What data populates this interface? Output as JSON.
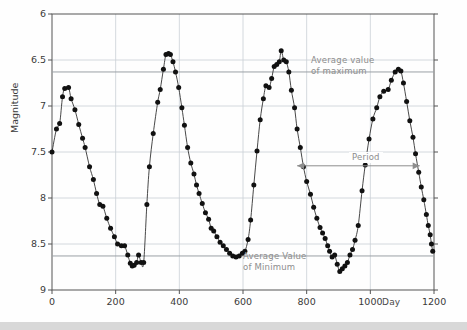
{
  "chart_data": {
    "type": "scatter",
    "title": "",
    "xlabel": "Day",
    "ylabel": "Magnitude",
    "xlim": [
      0,
      1200
    ],
    "ylim": [
      9,
      6
    ],
    "y_inverted": true,
    "grid": true,
    "xticks": [
      0,
      200,
      400,
      600,
      800,
      1000,
      1200
    ],
    "xtick_labels": [
      "0",
      "200",
      "400",
      "600",
      "800",
      "1000",
      "1200"
    ],
    "yticks": [
      6,
      6.5,
      7,
      7.5,
      8,
      8.5,
      9
    ],
    "ytick_labels": [
      "6",
      "6.5",
      "7",
      "7.5",
      "8",
      "8.5",
      "9"
    ],
    "reference_lines": [
      {
        "name": "average-value-of-maximum",
        "y": 6.63,
        "label": "Average value\nof maximum"
      },
      {
        "name": "average-value-of-minimum",
        "y": 8.63,
        "label": "Average Value\nof Minimum"
      }
    ],
    "annotations": [
      {
        "name": "period-span",
        "label": "Period",
        "x_start": 770,
        "x_end": 1155,
        "y": 7.65
      }
    ],
    "series": [
      {
        "name": "variable-star-light-curve",
        "marker": "filled-circle",
        "line": "smooth",
        "points": [
          [
            0,
            7.5
          ],
          [
            14,
            7.25
          ],
          [
            24,
            7.19
          ],
          [
            33,
            6.9
          ],
          [
            40,
            6.81
          ],
          [
            52,
            6.8
          ],
          [
            60,
            6.92
          ],
          [
            72,
            7.04
          ],
          [
            84,
            7.2
          ],
          [
            96,
            7.35
          ],
          [
            104,
            7.45
          ],
          [
            118,
            7.66
          ],
          [
            130,
            7.8
          ],
          [
            140,
            7.95
          ],
          [
            150,
            8.07
          ],
          [
            160,
            8.09
          ],
          [
            172,
            8.22
          ],
          [
            184,
            8.33
          ],
          [
            196,
            8.42
          ],
          [
            206,
            8.5
          ],
          [
            218,
            8.52
          ],
          [
            228,
            8.52
          ],
          [
            238,
            8.62
          ],
          [
            246,
            8.71
          ],
          [
            252,
            8.74
          ],
          [
            258,
            8.73
          ],
          [
            266,
            8.7
          ],
          [
            272,
            8.62
          ],
          [
            280,
            8.7
          ],
          [
            288,
            8.7
          ],
          [
            298,
            8.07
          ],
          [
            306,
            7.66
          ],
          [
            318,
            7.3
          ],
          [
            332,
            6.96
          ],
          [
            340,
            6.82
          ],
          [
            350,
            6.6
          ],
          [
            358,
            6.44
          ],
          [
            366,
            6.43
          ],
          [
            372,
            6.44
          ],
          [
            380,
            6.52
          ],
          [
            388,
            6.63
          ],
          [
            398,
            6.8
          ],
          [
            408,
            7.02
          ],
          [
            416,
            7.21
          ],
          [
            426,
            7.45
          ],
          [
            436,
            7.62
          ],
          [
            446,
            7.74
          ],
          [
            454,
            7.86
          ],
          [
            462,
            7.95
          ],
          [
            472,
            8.06
          ],
          [
            482,
            8.16
          ],
          [
            492,
            8.23
          ],
          [
            500,
            8.33
          ],
          [
            508,
            8.36
          ],
          [
            518,
            8.42
          ],
          [
            528,
            8.48
          ],
          [
            538,
            8.52
          ],
          [
            548,
            8.56
          ],
          [
            558,
            8.6
          ],
          [
            568,
            8.63
          ],
          [
            578,
            8.64
          ],
          [
            588,
            8.63
          ],
          [
            598,
            8.6
          ],
          [
            606,
            8.58
          ],
          [
            616,
            8.45
          ],
          [
            624,
            8.24
          ],
          [
            634,
            7.86
          ],
          [
            644,
            7.49
          ],
          [
            654,
            7.15
          ],
          [
            664,
            6.92
          ],
          [
            672,
            6.78
          ],
          [
            682,
            6.8
          ],
          [
            690,
            6.7
          ],
          [
            698,
            6.57
          ],
          [
            706,
            6.55
          ],
          [
            714,
            6.52
          ],
          [
            720,
            6.4
          ],
          [
            728,
            6.5
          ],
          [
            736,
            6.52
          ],
          [
            744,
            6.63
          ],
          [
            752,
            6.83
          ],
          [
            762,
            7.02
          ],
          [
            770,
            7.25
          ],
          [
            780,
            7.45
          ],
          [
            790,
            7.66
          ],
          [
            800,
            7.82
          ],
          [
            812,
            7.96
          ],
          [
            822,
            8.1
          ],
          [
            832,
            8.22
          ],
          [
            842,
            8.32
          ],
          [
            850,
            8.38
          ],
          [
            858,
            8.44
          ],
          [
            866,
            8.52
          ],
          [
            872,
            8.58
          ],
          [
            880,
            8.64
          ],
          [
            888,
            8.62
          ],
          [
            896,
            8.72
          ],
          [
            904,
            8.8
          ],
          [
            912,
            8.77
          ],
          [
            920,
            8.74
          ],
          [
            928,
            8.7
          ],
          [
            936,
            8.62
          ],
          [
            944,
            8.56
          ],
          [
            952,
            8.46
          ],
          [
            962,
            8.3
          ],
          [
            974,
            7.92
          ],
          [
            984,
            7.64
          ],
          [
            996,
            7.36
          ],
          [
            1008,
            7.14
          ],
          [
            1020,
            7.02
          ],
          [
            1030,
            6.9
          ],
          [
            1042,
            6.84
          ],
          [
            1056,
            6.82
          ],
          [
            1066,
            6.72
          ],
          [
            1078,
            6.63
          ],
          [
            1088,
            6.6
          ],
          [
            1096,
            6.62
          ],
          [
            1104,
            6.75
          ],
          [
            1114,
            6.95
          ],
          [
            1124,
            7.16
          ],
          [
            1134,
            7.34
          ],
          [
            1142,
            7.52
          ],
          [
            1152,
            7.72
          ],
          [
            1160,
            7.88
          ],
          [
            1168,
            8.02
          ],
          [
            1176,
            8.18
          ],
          [
            1182,
            8.3
          ],
          [
            1188,
            8.4
          ],
          [
            1192,
            8.5
          ],
          [
            1196,
            8.58
          ]
        ]
      }
    ],
    "colors": {
      "marker": "#111111",
      "line": "#333333",
      "grid": "#c9cfd6",
      "axis": "#555555",
      "annotation": "#8d8d8d"
    }
  }
}
